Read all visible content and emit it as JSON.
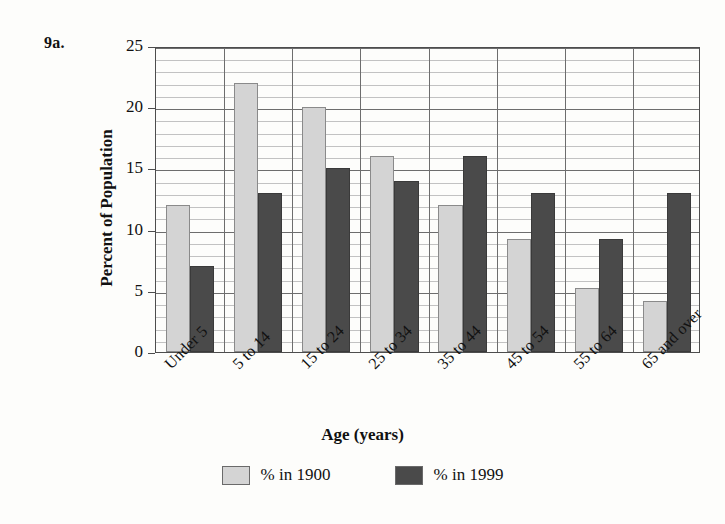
{
  "figure": {
    "number_label": "9a."
  },
  "chart_data": {
    "type": "bar",
    "title": "",
    "xlabel": "Age (years)",
    "ylabel": "Percent of Population",
    "categories": [
      "Under 5",
      "5 to 14",
      "15 to 24",
      "25 to 34",
      "35 to 44",
      "45 to 54",
      "55 to 64",
      "65 and over"
    ],
    "series": [
      {
        "name": "% in 1900",
        "color": "#d4d4d4",
        "values": [
          12,
          22,
          20,
          16,
          12,
          9.2,
          5.2,
          4.2
        ]
      },
      {
        "name": "% in 1999",
        "color": "#4a4a4a",
        "values": [
          7,
          13,
          15,
          14,
          16,
          13,
          9.2,
          13
        ]
      }
    ],
    "ylim": [
      0,
      25
    ],
    "ytick_values": [
      0,
      5,
      10,
      15,
      20,
      25
    ],
    "ytick_labels": [
      "0",
      "5",
      "10",
      "15",
      "20",
      "25"
    ],
    "minor_tick_step": 1,
    "grid": true,
    "grid_axis": "y",
    "legend_position": "bottom",
    "xtick_rotation": -45
  },
  "legend": {
    "items": [
      {
        "label": "% in 1900",
        "color": "#d4d4d4"
      },
      {
        "label": "% in 1999",
        "color": "#4a4a4a"
      }
    ]
  },
  "colors": {
    "series_1900": "#d4d4d4",
    "series_1999": "#4a4a4a",
    "axis": "#4d4d4d",
    "grid_minor": "#c2c2c2",
    "grid_major": "#6d6d6d",
    "background": "#fdfdfb"
  }
}
